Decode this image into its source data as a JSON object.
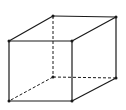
{
  "diagram": {
    "type": "wireframe-cube",
    "stroke_color": "#1a1a1a",
    "background": "#ffffff",
    "vertices": {
      "front_top_left": [
        9,
        41
      ],
      "front_top_right": [
        72,
        41
      ],
      "front_bottom_left": [
        9,
        101
      ],
      "front_bottom_right": [
        72,
        101
      ],
      "back_top_left": [
        53,
        16
      ],
      "back_top_right": [
        116,
        17
      ],
      "back_bottom_left": [
        53,
        77
      ],
      "back_bottom_right": [
        116,
        78
      ]
    },
    "solid_edges": [
      [
        "front_top_left",
        "front_top_right"
      ],
      [
        "front_top_right",
        "front_bottom_right"
      ],
      [
        "front_bottom_right",
        "front_bottom_left"
      ],
      [
        "front_bottom_left",
        "front_top_left"
      ],
      [
        "back_top_left",
        "back_top_right"
      ],
      [
        "back_top_right",
        "back_bottom_right"
      ],
      [
        "front_top_left",
        "back_top_left"
      ],
      [
        "front_top_right",
        "back_top_right"
      ],
      [
        "front_bottom_right",
        "back_bottom_right"
      ]
    ],
    "hidden_edges": [
      [
        "back_top_left",
        "back_bottom_left"
      ],
      [
        "back_bottom_left",
        "back_bottom_right"
      ],
      [
        "back_bottom_left",
        "front_bottom_left"
      ]
    ]
  }
}
